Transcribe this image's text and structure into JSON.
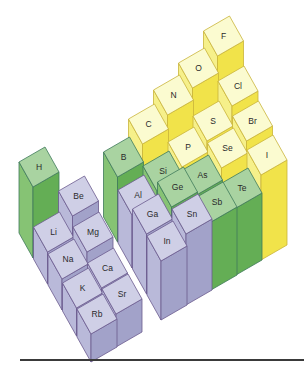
{
  "diagram": {
    "geometry": {
      "group_vec": [
        26,
        -15
      ],
      "row_vec": [
        14,
        25
      ],
      "origin_x": 24.5,
      "floor_y0": 212,
      "step_x_group": 25,
      "step_x_row": 14.5,
      "step_y_group": -15,
      "step_y_row": 26
    },
    "palette": {
      "s_block": {
        "top": "#cfcfe6",
        "left": "#b9b9d9",
        "front": "#a2a2c9",
        "edge": "#6b5b8e"
      },
      "metalloid": {
        "top": "#a9d3a1",
        "left": "#86c374",
        "front": "#64ae55",
        "edge": "#3f7a5a"
      },
      "nonmetal": {
        "top": "#fbfbd0",
        "left": "#f6f08a",
        "front": "#f1e34a",
        "edge": "#c9b43a"
      },
      "p_metal": {
        "top": "#cfcfe6",
        "left": "#b9b9d9",
        "front": "#a2a2c9",
        "edge": "#6b5b8e"
      }
    },
    "elements": [
      {
        "symbol": "H",
        "g": 0,
        "r": 1,
        "h": 71,
        "cat": "metalloid"
      },
      {
        "symbol": "Li",
        "g": 0,
        "r": 2,
        "h": 32,
        "cat": "s_block"
      },
      {
        "symbol": "Be",
        "g": 1,
        "r": 2,
        "h": 53,
        "cat": "s_block"
      },
      {
        "symbol": "Na",
        "g": 0,
        "r": 3,
        "h": 31,
        "cat": "s_block"
      },
      {
        "symbol": "Mg",
        "g": 1,
        "r": 3,
        "h": 43,
        "cat": "s_block"
      },
      {
        "symbol": "K",
        "g": 0,
        "r": 4,
        "h": 28,
        "cat": "s_block"
      },
      {
        "symbol": "Ca",
        "g": 1,
        "r": 4,
        "h": 33,
        "cat": "s_block"
      },
      {
        "symbol": "Rb",
        "g": 0,
        "r": 5,
        "h": 28,
        "cat": "s_block"
      },
      {
        "symbol": "Sr",
        "g": 1,
        "r": 5,
        "h": 33,
        "cat": "s_block"
      },
      {
        "symbol": "B",
        "g": 2.8,
        "r": 2,
        "h": 65,
        "cat": "metalloid"
      },
      {
        "symbol": "C",
        "g": 3.8,
        "r": 2,
        "h": 83,
        "cat": "nonmetal"
      },
      {
        "symbol": "N",
        "g": 4.8,
        "r": 2,
        "h": 97,
        "cat": "nonmetal"
      },
      {
        "symbol": "O",
        "g": 5.8,
        "r": 2,
        "h": 109,
        "cat": "nonmetal"
      },
      {
        "symbol": "F",
        "g": 6.8,
        "r": 2,
        "h": 126,
        "cat": "nonmetal"
      },
      {
        "symbol": "Al",
        "g": 2.8,
        "r": 3,
        "h": 53,
        "cat": "p_metal"
      },
      {
        "symbol": "Si",
        "g": 3.8,
        "r": 3,
        "h": 62,
        "cat": "metalloid"
      },
      {
        "symbol": "P",
        "g": 4.8,
        "r": 3,
        "h": 71,
        "cat": "nonmetal"
      },
      {
        "symbol": "S",
        "g": 5.8,
        "r": 3,
        "h": 82,
        "cat": "nonmetal"
      },
      {
        "symbol": "Cl",
        "g": 6.8,
        "r": 3,
        "h": 102,
        "cat": "nonmetal"
      },
      {
        "symbol": "Ga",
        "g": 2.8,
        "r": 4,
        "h": 60,
        "cat": "p_metal"
      },
      {
        "symbol": "Ge",
        "g": 3.8,
        "r": 4,
        "h": 72,
        "cat": "metalloid"
      },
      {
        "symbol": "As",
        "g": 4.8,
        "r": 4,
        "h": 69,
        "cat": "metalloid"
      },
      {
        "symbol": "Se",
        "g": 5.8,
        "r": 4,
        "h": 81,
        "cat": "nonmetal"
      },
      {
        "symbol": "Br",
        "g": 6.8,
        "r": 4,
        "h": 93,
        "cat": "nonmetal"
      },
      {
        "symbol": "In",
        "g": 2.8,
        "r": 5,
        "h": 59,
        "cat": "p_metal"
      },
      {
        "symbol": "Sn",
        "g": 3.8,
        "r": 5,
        "h": 71,
        "cat": "p_metal"
      },
      {
        "symbol": "Sb",
        "g": 4.8,
        "r": 5,
        "h": 68,
        "cat": "metalloid"
      },
      {
        "symbol": "Te",
        "g": 5.8,
        "r": 5,
        "h": 67,
        "cat": "metalloid"
      },
      {
        "symbol": "I",
        "g": 6.8,
        "r": 5,
        "h": 85,
        "cat": "nonmetal"
      }
    ],
    "baseline_rule_color": "#3a3a3a"
  }
}
